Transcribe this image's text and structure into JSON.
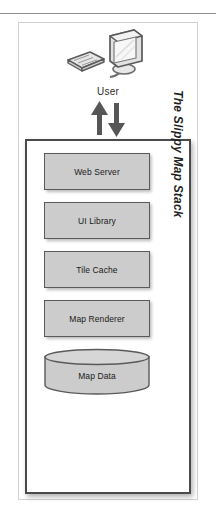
{
  "figure": {
    "title": "The Slippy Map Stack",
    "user_label": "User",
    "user_icon": "desktop-computer-icon",
    "flow_icon_up": "arrow-up-icon",
    "flow_icon_down": "arrow-down-icon",
    "scan_artifact_text": "",
    "layers": [
      {
        "label": "Web Server",
        "shape": "rectangle"
      },
      {
        "label": "UI Library",
        "shape": "rectangle"
      },
      {
        "label": "Tile Cache",
        "shape": "rectangle"
      },
      {
        "label": "Map Renderer",
        "shape": "rectangle"
      },
      {
        "label": "Map Data",
        "shape": "cylinder"
      }
    ],
    "colors": {
      "layer_fill": "#cccccc",
      "layer_stroke": "#5a5a5a",
      "box_stroke": "#4a4a4a",
      "frame_stroke": "#d2d2d2",
      "rule": "#8d8d8d",
      "text": "#1a1a1a",
      "arrow": "#565656"
    }
  }
}
